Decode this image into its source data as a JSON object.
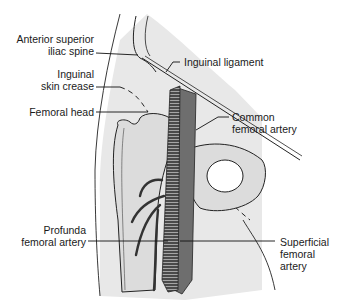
{
  "diagram": {
    "colors": {
      "background": "#ffffff",
      "skin_shade": "#e6e6e6",
      "bone_fill": "#dcdcdc",
      "artery_dark": "#3a3a3a",
      "vein": "#6e6e6e",
      "line": "#111111"
    },
    "labels": {
      "asis": {
        "line1": "Anterior superior",
        "line2": "iliac spine"
      },
      "skin_crease": {
        "line1": "Inguinal",
        "line2": "skin crease"
      },
      "femoral_head": {
        "line1": "Femoral head"
      },
      "inguinal_ligament": {
        "line1": "Inguinal ligament"
      },
      "common_femoral": {
        "line1": "Common",
        "line2": "femoral artery"
      },
      "profunda": {
        "line1": "Profunda",
        "line2": "femoral artery"
      },
      "superficial_femoral": {
        "line1": "Superficial",
        "line2": "femoral",
        "line3": "artery"
      }
    }
  }
}
